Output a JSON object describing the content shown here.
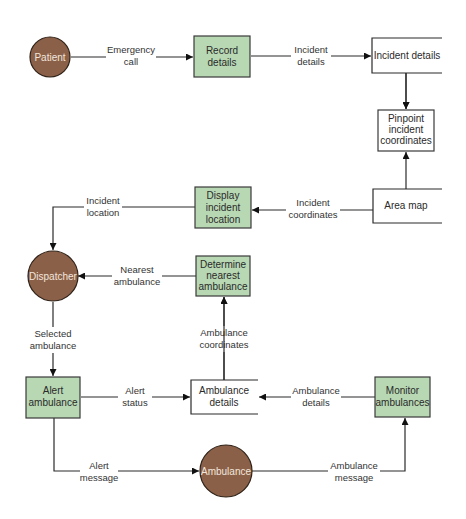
{
  "diagram": {
    "type": "data-flow-diagram",
    "colors": {
      "process_fill": "#b8d8b4",
      "entity_fill": "#8b6048",
      "entity_text": "#f2e6dc",
      "line": "#2b2b2b",
      "background": "#ffffff"
    },
    "entities": {
      "patient": "Patient",
      "dispatcher": "Dispatcher",
      "ambulance": "Ambulance"
    },
    "processes": {
      "record_details": [
        "Record",
        "details"
      ],
      "pinpoint": [
        "Pinpoint",
        "incident",
        "coordinates"
      ],
      "display_location": [
        "Display",
        "incident",
        "location"
      ],
      "determine_nearest": [
        "Determine",
        "nearest",
        "ambulance"
      ],
      "alert_ambulance": [
        "Alert",
        "ambulance"
      ],
      "monitor_ambulances": [
        "Monitor",
        "ambulances"
      ]
    },
    "data_stores": {
      "incident_details": "Incident details",
      "area_map": "Area map",
      "ambulance_details": [
        "Ambulance",
        "details"
      ]
    },
    "flows": {
      "emergency_call": [
        "Emergency",
        "call"
      ],
      "incident_details": [
        "Incident",
        "details"
      ],
      "incident_coordinates": [
        "Incident",
        "coordinates"
      ],
      "incident_location": [
        "Incident",
        "location"
      ],
      "nearest_ambulance": [
        "Nearest",
        "ambulance"
      ],
      "selected_ambulance": [
        "Selected",
        "ambulance"
      ],
      "ambulance_coordinates": [
        "Ambulance",
        "coordinates"
      ],
      "alert_status": [
        "Alert",
        "status"
      ],
      "ambulance_details": [
        "Ambulance",
        "details"
      ],
      "alert_message": [
        "Alert",
        "message"
      ],
      "ambulance_message": [
        "Ambulance",
        "message"
      ]
    }
  }
}
